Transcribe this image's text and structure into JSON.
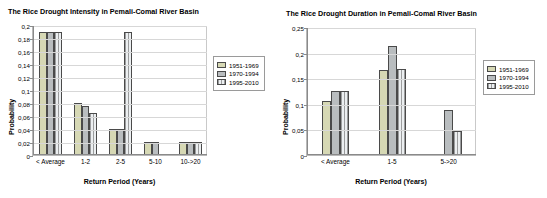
{
  "charts": [
    {
      "title": "The Rice Drought Intensity in Pemali-Comal River Basin",
      "xlabel": "Return Period (Years)",
      "ylabel": "Probability",
      "legend": [
        "1951-1969",
        "1970-1994",
        "1995-2010"
      ],
      "categories": [
        "< Average",
        "1-2",
        "2-5",
        "5-10",
        "10->20"
      ],
      "yticks": [
        "0,2",
        "0,18",
        "0,16",
        "0,14",
        "0,12",
        "0,1",
        "0,08",
        "0,06",
        "0,04",
        "0,02",
        "0"
      ]
    },
    {
      "title": "The Rice Drought Duration in Pemali-Comal River Basin",
      "xlabel": "Return Period (Years)",
      "ylabel": "Probability",
      "legend": [
        "1951-1969",
        "1970-1994",
        "1995-2010"
      ],
      "categories": [
        "< Average",
        "1-5",
        "5->20"
      ],
      "yticks": [
        "0,25",
        "0,2",
        "0,15",
        "0,1",
        "0,05",
        "0"
      ]
    }
  ],
  "chart_data": [
    {
      "type": "bar",
      "title": "The Rice Drought Intensity in Pemali-Comal River Basin",
      "xlabel": "Return Period (Years)",
      "ylabel": "Probability",
      "categories": [
        "< Average",
        "1-2",
        "2-5",
        "5-10",
        "10->20"
      ],
      "series": [
        {
          "name": "1951-1969",
          "values": [
            0.19,
            0.08,
            0.04,
            0.02,
            0.02
          ]
        },
        {
          "name": "1970-1994",
          "values": [
            0.19,
            0.075,
            0.04,
            0.02,
            0.02
          ]
        },
        {
          "name": "1995-2010",
          "values": [
            0.19,
            0.065,
            0.19,
            0.0,
            0.02
          ]
        }
      ],
      "ylim": [
        0,
        0.2
      ],
      "ytick_values": [
        0,
        0.02,
        0.04,
        0.06,
        0.08,
        0.1,
        0.12,
        0.14,
        0.16,
        0.18,
        0.2
      ],
      "grid": true,
      "legend_position": "right"
    },
    {
      "type": "bar",
      "title": "The Rice Drought Duration in Pemali-Comal River Basin",
      "xlabel": "Return Period (Years)",
      "ylabel": "Probability",
      "categories": [
        "< Average",
        "1-5",
        "5->20"
      ],
      "series": [
        {
          "name": "1951-1969",
          "values": [
            0.105,
            0.167,
            0.0
          ]
        },
        {
          "name": "1970-1994",
          "values": [
            0.125,
            0.212,
            0.088
          ]
        },
        {
          "name": "1995-2010",
          "values": [
            0.125,
            0.168,
            0.046
          ]
        }
      ],
      "ylim": [
        0,
        0.25
      ],
      "ytick_values": [
        0,
        0.05,
        0.1,
        0.15,
        0.2,
        0.25
      ],
      "grid": true,
      "legend_position": "right"
    }
  ]
}
